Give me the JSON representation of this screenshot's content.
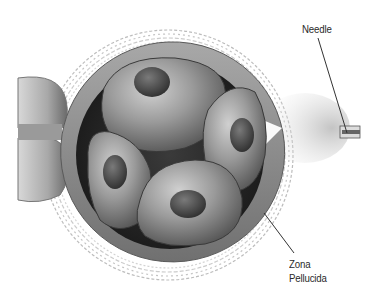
{
  "figure": {
    "labels": {
      "needle": "Needle",
      "zona_line1": "Zona",
      "zona_line2": "Pellucida"
    },
    "colors": {
      "background": "#ffffff",
      "zona_pellucida": "#8a8a8a",
      "perivitelline_space": "#2a2a2a",
      "cell": "#9a9a9a",
      "nucleus": "#4a4a4a",
      "cumulus_fibers": "#b8b8b8",
      "label_text": "#2a2a2a",
      "leader_line": "#333333"
    }
  }
}
